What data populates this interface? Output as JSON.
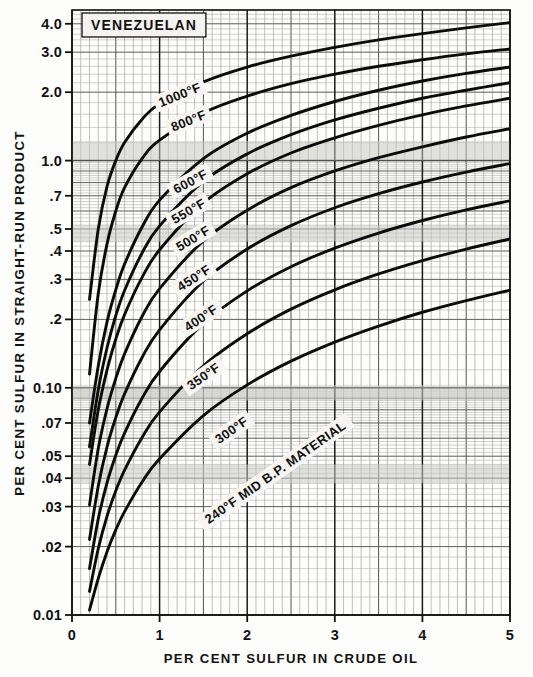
{
  "figure": {
    "annotation_box": "VENEZUELAN",
    "x_axis_title": "PER CENT SULFUR IN CRUDE OIL",
    "y_axis_title": "PER CENT SULFUR IN STRAIGHT-RUN PRODUCT"
  },
  "chart_data": {
    "type": "line",
    "title": "VENEZUELAN",
    "xlabel": "PER CENT SULFUR IN CRUDE OIL",
    "ylabel": "PER CENT SULFUR IN STRAIGHT-RUN PRODUCT",
    "xscale": "linear",
    "yscale": "log",
    "xlim": [
      0,
      5
    ],
    "ylim": [
      0.01,
      4.6
    ],
    "grid": true,
    "legend": "inline-curve-labels",
    "x_ticks": [
      "0",
      "1",
      "2",
      "3",
      "4",
      "5"
    ],
    "x_tick_values": [
      0,
      1,
      2,
      3,
      4,
      5
    ],
    "y_ticks": [
      "4.0",
      "3.0",
      "2.0",
      "1.0",
      ".7",
      ".5",
      ".4",
      ".3",
      ".2",
      "0.10",
      ".07",
      ".05",
      ".04",
      ".03",
      ".02",
      "0.01"
    ],
    "y_tick_values": [
      4.0,
      3.0,
      2.0,
      1.0,
      0.7,
      0.5,
      0.4,
      0.3,
      0.2,
      0.1,
      0.07,
      0.05,
      0.04,
      0.03,
      0.02,
      0.01
    ],
    "series": [
      {
        "name": "1000°F",
        "label": "1000°F",
        "x": [
          0.2,
          0.3,
          0.4,
          0.5,
          0.6,
          0.8,
          1.0,
          1.5,
          2.0,
          2.5,
          3.0,
          3.5,
          4.0,
          4.5,
          5.0
        ],
        "y": [
          0.245,
          0.5,
          0.77,
          1.0,
          1.2,
          1.52,
          1.78,
          2.22,
          2.58,
          2.88,
          3.15,
          3.4,
          3.62,
          3.84,
          4.05
        ]
      },
      {
        "name": "800°F",
        "label": "800°F",
        "x": [
          0.2,
          0.3,
          0.4,
          0.5,
          0.6,
          0.8,
          1.0,
          1.5,
          2.0,
          2.5,
          3.0,
          3.5,
          4.0,
          4.5,
          5.0
        ],
        "y": [
          0.115,
          0.26,
          0.43,
          0.6,
          0.76,
          1.02,
          1.23,
          1.62,
          1.92,
          2.18,
          2.4,
          2.6,
          2.78,
          2.95,
          3.1
        ]
      },
      {
        "name": "600°F",
        "label": "600°F",
        "x": [
          0.2,
          0.3,
          0.4,
          0.5,
          0.6,
          0.8,
          1.0,
          1.5,
          2.0,
          2.5,
          3.0,
          3.5,
          4.0,
          4.5,
          5.0
        ],
        "y": [
          0.07,
          0.125,
          0.195,
          0.27,
          0.35,
          0.51,
          0.67,
          1.02,
          1.32,
          1.58,
          1.82,
          2.04,
          2.24,
          2.42,
          2.58
        ]
      },
      {
        "name": "550°F",
        "label": "550°F",
        "x": [
          0.2,
          0.3,
          0.4,
          0.5,
          0.6,
          0.8,
          1.0,
          1.5,
          2.0,
          2.5,
          3.0,
          3.5,
          4.0,
          4.5,
          5.0
        ],
        "y": [
          0.055,
          0.098,
          0.15,
          0.208,
          0.268,
          0.392,
          0.516,
          0.81,
          1.07,
          1.3,
          1.51,
          1.7,
          1.88,
          2.04,
          2.2
        ]
      },
      {
        "name": "500°F",
        "label": "500°F",
        "x": [
          0.2,
          0.3,
          0.4,
          0.5,
          0.6,
          0.8,
          1.0,
          1.5,
          2.0,
          2.5,
          3.0,
          3.5,
          4.0,
          4.5,
          5.0
        ],
        "y": [
          0.046,
          0.08,
          0.12,
          0.164,
          0.21,
          0.306,
          0.405,
          0.65,
          0.875,
          1.08,
          1.26,
          1.43,
          1.59,
          1.74,
          1.88
        ]
      },
      {
        "name": "450°F",
        "label": "450°F",
        "x": [
          0.2,
          0.3,
          0.4,
          0.5,
          0.6,
          0.8,
          1.0,
          1.5,
          2.0,
          2.5,
          3.0,
          3.5,
          4.0,
          4.5,
          5.0
        ],
        "y": [
          0.0305,
          0.054,
          0.081,
          0.11,
          0.141,
          0.206,
          0.273,
          0.443,
          0.605,
          0.76,
          0.9,
          1.03,
          1.15,
          1.27,
          1.38
        ]
      },
      {
        "name": "400°F",
        "label": "400°F",
        "x": [
          0.2,
          0.3,
          0.4,
          0.5,
          0.6,
          0.8,
          1.0,
          1.5,
          2.0,
          2.5,
          3.0,
          3.5,
          4.0,
          4.5,
          5.0
        ],
        "y": [
          0.0215,
          0.037,
          0.055,
          0.074,
          0.094,
          0.136,
          0.18,
          0.295,
          0.408,
          0.517,
          0.62,
          0.715,
          0.805,
          0.89,
          0.97
        ]
      },
      {
        "name": "350°F",
        "label": "350°F",
        "x": [
          0.2,
          0.3,
          0.4,
          0.5,
          0.6,
          0.8,
          1.0,
          1.5,
          2.0,
          2.5,
          3.0,
          3.5,
          4.0,
          4.5,
          5.0
        ],
        "y": [
          0.016,
          0.0265,
          0.0382,
          0.0505,
          0.0632,
          0.09,
          0.118,
          0.192,
          0.267,
          0.341,
          0.412,
          0.48,
          0.545,
          0.607,
          0.665
        ]
      },
      {
        "name": "300°F",
        "label": "300°F",
        "x": [
          0.2,
          0.3,
          0.4,
          0.5,
          0.6,
          0.8,
          1.0,
          1.5,
          2.0,
          2.5,
          3.0,
          3.5,
          4.0,
          4.5,
          5.0
        ],
        "y": [
          0.0127,
          0.0196,
          0.0272,
          0.0352,
          0.0434,
          0.0605,
          0.0783,
          0.125,
          0.173,
          0.222,
          0.27,
          0.317,
          0.363,
          0.408,
          0.452
        ]
      },
      {
        "name": "240°F MID B.P. MATERIAL",
        "label": "240°F MID B.P. MATERIAL",
        "x": [
          0.2,
          0.3,
          0.4,
          0.5,
          0.6,
          0.8,
          1.0,
          1.5,
          2.0,
          2.5,
          3.0,
          3.5,
          4.0,
          4.5,
          5.0
        ],
        "y": [
          0.0105,
          0.0145,
          0.019,
          0.0237,
          0.0285,
          0.0385,
          0.0487,
          0.0755,
          0.103,
          0.131,
          0.159,
          0.187,
          0.215,
          0.242,
          0.269
        ]
      }
    ],
    "curve_labels": [
      {
        "text": "1000°F",
        "x": 1.23,
        "y": 1.95,
        "rotation": -22
      },
      {
        "text": "800°F",
        "x": 1.33,
        "y": 1.5,
        "rotation": -22
      },
      {
        "text": "600°F",
        "x": 1.35,
        "y": 0.81,
        "rotation": -28
      },
      {
        "text": "550°F",
        "x": 1.33,
        "y": 0.6,
        "rotation": -30
      },
      {
        "text": "500°F",
        "x": 1.38,
        "y": 0.455,
        "rotation": -31
      },
      {
        "text": "450°F",
        "x": 1.39,
        "y": 0.305,
        "rotation": -33
      },
      {
        "text": "400°F",
        "x": 1.47,
        "y": 0.203,
        "rotation": -34
      },
      {
        "text": "350°F",
        "x": 1.5,
        "y": 0.1125,
        "rotation": -35
      },
      {
        "text": "300°F",
        "x": 1.82,
        "y": 0.0652,
        "rotation": -35
      },
      {
        "text": "240°F MID B.P. MATERIAL",
        "x": 2.32,
        "y": 0.0425,
        "rotation": -35
      }
    ]
  }
}
